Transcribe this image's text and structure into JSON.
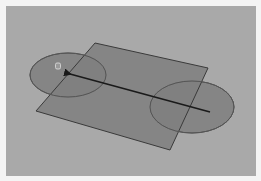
{
  "viewport": {
    "name": "3d-viewport",
    "background": "#a9a9a9",
    "frame_color": "#f4f4f4"
  },
  "scene": {
    "plane": {
      "points": "95,43 208,68 170,150 36,111",
      "fill": "#7f7f7f",
      "stroke": "#3a3a3a"
    },
    "ellipse_left": {
      "cx": 68,
      "cy": 75,
      "rx": 38,
      "ry": 22,
      "fill": "#858585",
      "stroke": "#555555"
    },
    "ellipse_right": {
      "cx": 192,
      "cy": 107,
      "rx": 42,
      "ry": 26,
      "fill": "#858585",
      "stroke": "#555555"
    },
    "arrow": {
      "x1": 210,
      "y1": 112,
      "x2": 70,
      "y2": 74,
      "color": "#1a1a1a"
    },
    "pivot_icon": {
      "name": "hand-cursor-icon",
      "x": 58,
      "y": 66
    }
  }
}
